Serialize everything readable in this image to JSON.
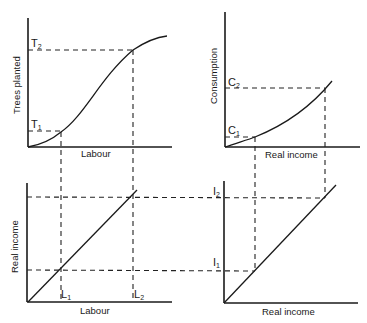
{
  "panels": {
    "top_left": {
      "y_label": "Trees planted",
      "x_label": "Labour",
      "t1": "T",
      "t1_sub": "1",
      "t2": "T",
      "t2_sub": "2",
      "curve_type": "S-shaped production function"
    },
    "top_right": {
      "y_label": "Consumption",
      "x_label": "Real income",
      "c1": "C",
      "c1_sub": "1",
      "c2": "C",
      "c2_sub": "2",
      "curve_type": "convex increasing"
    },
    "bottom_left": {
      "y_label": "Real income",
      "x_label": "Labour",
      "l1": "L",
      "l1_sub": "1",
      "l2": "L",
      "l2_sub": "2",
      "curve_type": "linear"
    },
    "bottom_right": {
      "y_label": "",
      "x_label": "Real income",
      "i1": "I",
      "i1_sub": "1",
      "i2": "I",
      "i2_sub": "2",
      "curve_type": "45-degree line"
    }
  },
  "colors": {
    "line": "#1a1a1a",
    "background": "#ffffff"
  }
}
